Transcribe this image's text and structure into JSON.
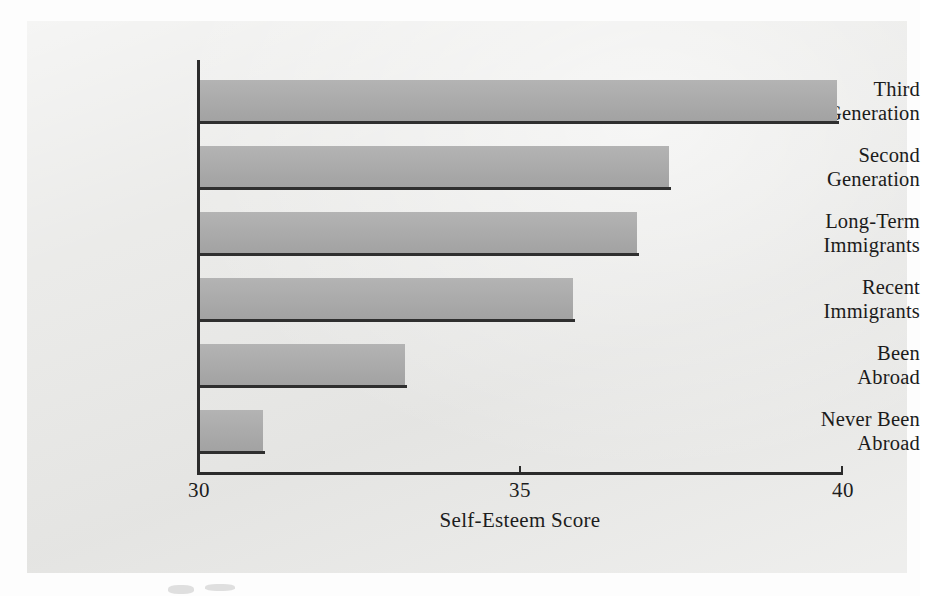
{
  "figure": {
    "background_color": "#e9e9e7",
    "bar_color": "#ababab",
    "axis_color": "#2b2b2b"
  },
  "chart_data": {
    "type": "bar",
    "orientation": "horizontal",
    "title": "",
    "xlabel": "Self-Esteem Score",
    "ylabel": "",
    "xlim": [
      30,
      40
    ],
    "xticks": [
      30,
      35,
      40
    ],
    "xtick_labels": [
      "30",
      "35",
      "40"
    ],
    "grid": false,
    "legend": null,
    "categories": [
      "Third Generation",
      "Second Generation",
      "Long-Term Immigrants",
      "Recent Immigrants",
      "Been Abroad",
      "Never Been Abroad"
    ],
    "category_lines": [
      [
        "Third",
        "Generation"
      ],
      [
        "Second",
        "Generation"
      ],
      [
        "Long-Term",
        "Immigrants"
      ],
      [
        "Recent",
        "Immigrants"
      ],
      [
        "Been",
        "Abroad"
      ],
      [
        "Never Been",
        "Abroad"
      ]
    ],
    "values": [
      39.9,
      37.3,
      36.8,
      35.8,
      33.2,
      31.0
    ]
  }
}
